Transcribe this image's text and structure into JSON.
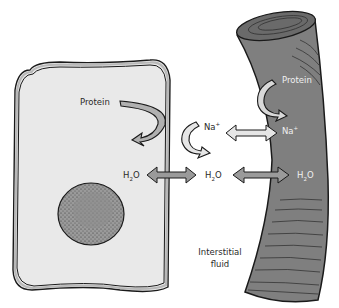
{
  "diagram": {
    "colors": {
      "background": "#ffffff",
      "cell_fill": "#e9e9e9",
      "cell_membrane": "#b8b8b8",
      "nucleus": "#8c8c8c",
      "vessel": "#7f7f7f",
      "vessel_dark": "#5e5e5e",
      "arrow_dark": "#9a9a9a",
      "arrow_light": "#e6e6e6",
      "outline": "#1a1a1a"
    },
    "labels": {
      "cell_protein": "Protein",
      "vessel_protein": "Protein",
      "na_interstitial": "Na",
      "na_vessel": "Na",
      "na_charge": "+",
      "h2o_cell": "H",
      "h2o_interstitial": "H",
      "h2o_vessel": "H",
      "h2o_sub": "2",
      "h2o_tail": "O",
      "interstitial_line1": "Interstitial",
      "interstitial_line2": "fluid"
    },
    "regions": [
      {
        "name": "cell",
        "contains": [
          "Protein",
          "nucleus",
          "H2O"
        ]
      },
      {
        "name": "interstitial fluid",
        "contains": [
          "Na+",
          "H2O"
        ]
      },
      {
        "name": "blood vessel",
        "contains": [
          "Protein",
          "Na+",
          "H2O"
        ]
      }
    ],
    "exchanges": [
      {
        "from": "cell",
        "to": "interstitial fluid",
        "substance": "H2O",
        "direction": "bidirectional"
      },
      {
        "from": "interstitial fluid",
        "to": "blood vessel",
        "substance": "H2O",
        "direction": "bidirectional"
      },
      {
        "from": "interstitial fluid",
        "to": "blood vessel",
        "substance": "Na+",
        "direction": "bidirectional"
      },
      {
        "from": "cell",
        "to": "cell",
        "substance": "Protein",
        "direction": "retained"
      },
      {
        "from": "blood vessel",
        "to": "blood vessel",
        "substance": "Protein",
        "direction": "retained"
      },
      {
        "from": "interstitial fluid",
        "to": "interstitial fluid",
        "substance": "Na+",
        "direction": "retained"
      }
    ]
  }
}
